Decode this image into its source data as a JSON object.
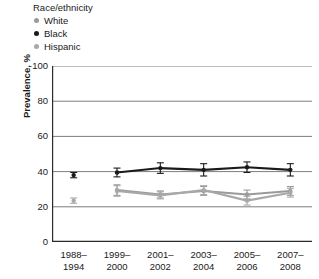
{
  "legend": {
    "title": "Race/ethnicity",
    "entries": [
      {
        "label": "White",
        "color": "#9a9a9a",
        "marker": "circle-icon"
      },
      {
        "label": "Black",
        "color": "#1a1a1a",
        "marker": "circle-icon"
      },
      {
        "label": "Hispanic",
        "color": "#a8a8a8",
        "marker": "circle-icon"
      }
    ]
  },
  "chart_data": {
    "type": "line",
    "title": "",
    "xlabel": "",
    "ylabel": "Prevalence, %",
    "ylim": [
      0,
      100
    ],
    "yticks": [
      0,
      20,
      40,
      60,
      80,
      100
    ],
    "ytick_labels": [
      "0",
      "20",
      "40",
      "60",
      "80",
      "100"
    ],
    "grid": true,
    "grid_axis": "y",
    "legend_position": "top-left-outside",
    "categories": [
      "1988–1994",
      "1999–2000",
      "2001–2002",
      "2003–2004",
      "2005–2006",
      "2007–2008"
    ],
    "category_lines": [
      [
        "1988–",
        "1994"
      ],
      [
        "1999–",
        "2000"
      ],
      [
        "2001–",
        "2002"
      ],
      [
        "2003–",
        "2004"
      ],
      [
        "2005–",
        "2006"
      ],
      [
        "2007–",
        "2008"
      ]
    ],
    "series": [
      {
        "name": "White",
        "color": "#9a9a9a",
        "connected_from_index": 1,
        "values": [
          null,
          29.5,
          27.0,
          29.0,
          27.0,
          29.0
        ],
        "errors_low": [
          null,
          26.5,
          25.0,
          26.5,
          24.5,
          26.5
        ],
        "errors_high": [
          null,
          32.5,
          29.0,
          31.5,
          29.5,
          31.5
        ]
      },
      {
        "name": "Black",
        "color": "#1a1a1a",
        "connected_from_index": 1,
        "values": [
          38.0,
          39.5,
          42.0,
          41.0,
          42.5,
          41.0
        ],
        "errors_low": [
          36.5,
          37.0,
          39.0,
          37.5,
          39.5,
          37.5
        ],
        "errors_high": [
          39.5,
          42.0,
          45.0,
          44.5,
          45.5,
          44.5
        ]
      },
      {
        "name": "Hispanic",
        "color": "#a8a8a8",
        "connected_from_index": 1,
        "values": [
          23.5,
          29.0,
          26.5,
          29.5,
          23.5,
          28.0
        ],
        "errors_low": [
          22.0,
          26.0,
          24.5,
          27.0,
          21.0,
          25.5
        ],
        "errors_high": [
          25.0,
          32.0,
          28.5,
          32.0,
          26.0,
          30.5
        ]
      }
    ],
    "isolated_first_points": [
      {
        "series": "Black",
        "value": 38.0
      },
      {
        "series": "Hispanic",
        "value": 23.5
      }
    ]
  },
  "colors": {
    "axis": "#2b2b2b",
    "gridline": "#7d7d7d",
    "background": "#ffffff",
    "text": "#1a1a1a"
  }
}
